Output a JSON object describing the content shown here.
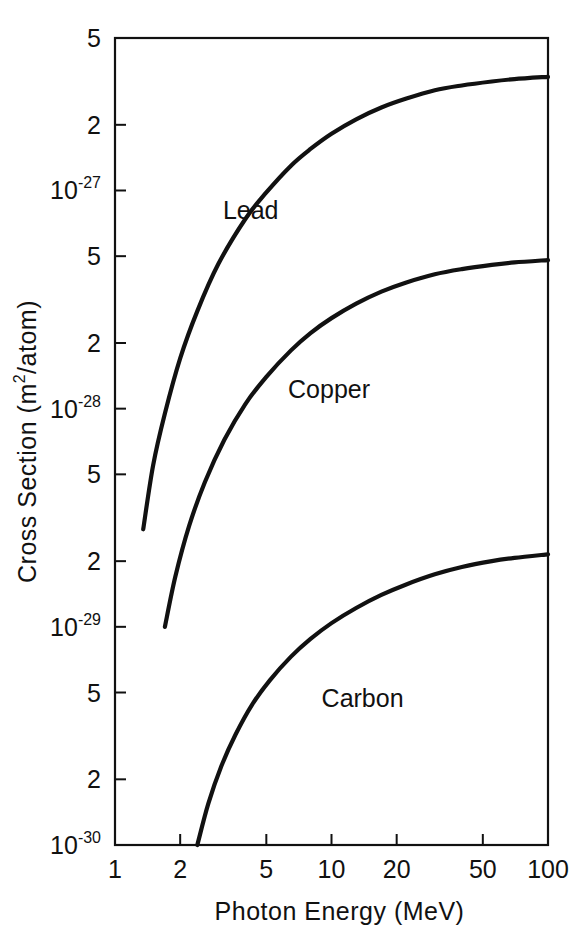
{
  "chart_data": {
    "type": "line",
    "title": "",
    "xlabel": "Photon Energy (MeV)",
    "ylabel": "Cross Section (m2/atom)",
    "ylabel_display": "Cross Section (m",
    "ylabel_sup": "2",
    "ylabel_tail": "/atom)",
    "xscale": "log",
    "yscale": "log",
    "xlim": [
      1,
      100
    ],
    "ylim": [
      1e-30,
      5e-27
    ],
    "grid": false,
    "legend": "inline-curve-labels",
    "xticks": [
      {
        "value": 1,
        "label": "1"
      },
      {
        "value": 2,
        "label": "2"
      },
      {
        "value": 5,
        "label": "5"
      },
      {
        "value": 10,
        "label": "10"
      },
      {
        "value": 20,
        "label": "20"
      },
      {
        "value": 50,
        "label": "50"
      },
      {
        "value": 100,
        "label": "100"
      }
    ],
    "yticks": [
      {
        "value": 5e-27,
        "mantissa": "5",
        "exponent": ""
      },
      {
        "value": 2e-27,
        "mantissa": "2",
        "exponent": ""
      },
      {
        "value": 1e-27,
        "mantissa": "10",
        "exponent": "-27"
      },
      {
        "value": 5e-28,
        "mantissa": "5",
        "exponent": ""
      },
      {
        "value": 2e-28,
        "mantissa": "2",
        "exponent": ""
      },
      {
        "value": 1e-28,
        "mantissa": "10",
        "exponent": "-28"
      },
      {
        "value": 5e-29,
        "mantissa": "5",
        "exponent": ""
      },
      {
        "value": 2e-29,
        "mantissa": "2",
        "exponent": ""
      },
      {
        "value": 1e-29,
        "mantissa": "10",
        "exponent": "-29"
      },
      {
        "value": 5e-30,
        "mantissa": "5",
        "exponent": ""
      },
      {
        "value": 2e-30,
        "mantissa": "2",
        "exponent": ""
      },
      {
        "value": 1e-30,
        "mantissa": "10",
        "exponent": "-30"
      }
    ],
    "series": [
      {
        "name": "Lead",
        "label": "Lead",
        "label_at": {
          "x": 3.15,
          "y": 7.4e-28
        },
        "color": "#111111",
        "x": [
          1.35,
          1.5,
          1.7,
          2.0,
          2.4,
          3.0,
          4.0,
          5.0,
          6.5,
          8.0,
          10.0,
          13.0,
          17.0,
          22.0,
          30.0,
          40.0,
          55.0,
          70.0,
          100.0
        ],
        "y": [
          2.8e-29,
          5.5e-29,
          9.5e-29,
          1.7e-28,
          2.8e-28,
          4.6e-28,
          7.4e-28,
          9.8e-28,
          1.3e-27,
          1.55e-27,
          1.82e-27,
          2.12e-27,
          2.4e-27,
          2.63e-27,
          2.88e-27,
          3.03e-27,
          3.16e-27,
          3.24e-27,
          3.32e-27
        ]
      },
      {
        "name": "Copper",
        "label": "Copper",
        "label_at": {
          "x": 6.3,
          "y": 1.12e-28
        },
        "color": "#111111",
        "x": [
          1.7,
          1.9,
          2.2,
          2.6,
          3.2,
          4.0,
          5.0,
          6.5,
          8.0,
          10.0,
          13.0,
          17.0,
          22.0,
          30.0,
          40.0,
          55.0,
          70.0,
          100.0
        ],
        "y": [
          1e-29,
          1.7e-29,
          2.9e-29,
          4.6e-29,
          7.2e-29,
          1.05e-28,
          1.4e-28,
          1.85e-28,
          2.22e-28,
          2.6e-28,
          3.03e-28,
          3.44e-28,
          3.78e-28,
          4.13e-28,
          4.36e-28,
          4.56e-28,
          4.68e-28,
          4.8e-28
        ]
      },
      {
        "name": "Carbon",
        "label": "Carbon",
        "label_at": {
          "x": 9.0,
          "y": 4.3e-30
        },
        "color": "#111111",
        "x": [
          2.4,
          2.7,
          3.1,
          3.6,
          4.3,
          5.2,
          6.5,
          8.0,
          10.0,
          13.0,
          17.0,
          22.0,
          30.0,
          40.0,
          55.0,
          70.0,
          100.0
        ],
        "y": [
          1e-30,
          1.55e-30,
          2.3e-30,
          3.2e-30,
          4.4e-30,
          5.7e-30,
          7.3e-30,
          8.8e-30,
          1.04e-29,
          1.22e-29,
          1.4e-29,
          1.56e-29,
          1.74e-29,
          1.88e-29,
          2e-29,
          2.07e-29,
          2.15e-29
        ]
      }
    ]
  },
  "plot_geometry": {
    "left": 115,
    "right": 548,
    "top": 38,
    "bottom": 845,
    "tick_length": 11
  }
}
